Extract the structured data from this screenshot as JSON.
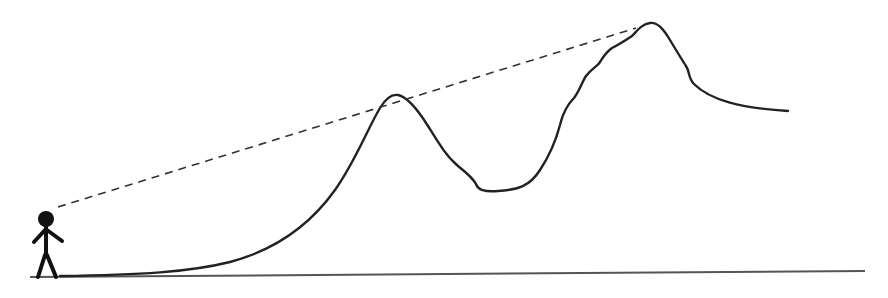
{
  "diagram": {
    "title": "",
    "description": "Line of sight from an observer over two mountain peaks",
    "colors": {
      "background": "#ffffff",
      "stroke": "#222222",
      "dashed_line": "#333333",
      "ground": "#444444"
    },
    "elements": [
      {
        "id": "observer",
        "type": "stick-figure"
      },
      {
        "id": "ground",
        "type": "line"
      },
      {
        "id": "terrain",
        "type": "curve",
        "peaks": 2
      },
      {
        "id": "sight-line",
        "type": "dashed-line"
      }
    ]
  }
}
